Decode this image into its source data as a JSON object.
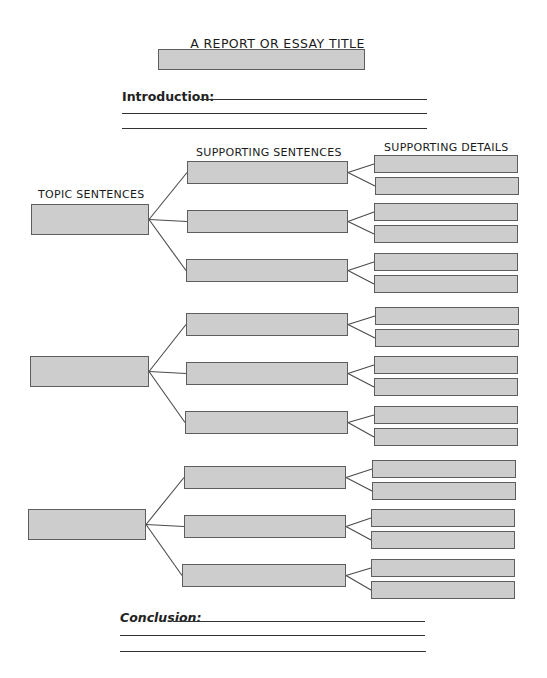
{
  "title": {
    "heading": "A REPORT OR ESSAY TITLE",
    "box": {
      "x": 158,
      "y": 49,
      "w": 207,
      "h": 21
    }
  },
  "introduction": {
    "label": "Introduction:",
    "label_pos": {
      "x": 122,
      "y": 89
    },
    "lines": [
      {
        "x1": 200,
        "x2": 427,
        "y": 99
      },
      {
        "x1": 122,
        "x2": 427,
        "y": 113
      },
      {
        "x1": 122,
        "x2": 427,
        "y": 128
      }
    ]
  },
  "column_headers": {
    "topic": "TOPIC SENTENCES",
    "supporting_sentences": "SUPPORTING SENTENCES",
    "supporting_details": "SUPPORTING DETAILS"
  },
  "column_header_pos": {
    "topic": {
      "x": 38,
      "y": 188
    },
    "supporting_sentences": {
      "x": 196,
      "y": 146
    },
    "supporting_details": {
      "x": 384,
      "y": 141
    }
  },
  "colors": {
    "box_fill": "#cdcdcd",
    "box_border": "#5e5e5e",
    "line": "#333333",
    "connector": "#4a4a4a"
  },
  "sections": [
    {
      "topic": {
        "x": 31,
        "y": 204,
        "w": 118,
        "h": 31
      },
      "supports": [
        {
          "box": {
            "x": 187,
            "y": 161,
            "w": 161,
            "h": 23
          },
          "details": [
            {
              "x": 374,
              "y": 155,
              "w": 144,
              "h": 18
            },
            {
              "x": 375,
              "y": 177,
              "w": 144,
              "h": 18
            }
          ]
        },
        {
          "box": {
            "x": 187,
            "y": 210,
            "w": 161,
            "h": 23
          },
          "details": [
            {
              "x": 374,
              "y": 203,
              "w": 144,
              "h": 18
            },
            {
              "x": 374,
              "y": 225,
              "w": 144,
              "h": 18
            }
          ]
        },
        {
          "box": {
            "x": 186,
            "y": 259,
            "w": 162,
            "h": 23
          },
          "details": [
            {
              "x": 374,
              "y": 253,
              "w": 144,
              "h": 18
            },
            {
              "x": 374,
              "y": 275,
              "w": 144,
              "h": 18
            }
          ]
        }
      ]
    },
    {
      "topic": {
        "x": 30,
        "y": 356,
        "w": 119,
        "h": 31
      },
      "supports": [
        {
          "box": {
            "x": 186,
            "y": 313,
            "w": 162,
            "h": 23
          },
          "details": [
            {
              "x": 375,
              "y": 307,
              "w": 144,
              "h": 18
            },
            {
              "x": 375,
              "y": 329,
              "w": 144,
              "h": 18
            }
          ]
        },
        {
          "box": {
            "x": 186,
            "y": 362,
            "w": 162,
            "h": 23
          },
          "details": [
            {
              "x": 374,
              "y": 356,
              "w": 144,
              "h": 18
            },
            {
              "x": 374,
              "y": 378,
              "w": 144,
              "h": 18
            }
          ]
        },
        {
          "box": {
            "x": 185,
            "y": 411,
            "w": 163,
            "h": 23
          },
          "details": [
            {
              "x": 374,
              "y": 406,
              "w": 144,
              "h": 18
            },
            {
              "x": 374,
              "y": 428,
              "w": 144,
              "h": 18
            }
          ]
        }
      ]
    },
    {
      "topic": {
        "x": 28,
        "y": 509,
        "w": 118,
        "h": 31
      },
      "supports": [
        {
          "box": {
            "x": 184,
            "y": 466,
            "w": 162,
            "h": 23
          },
          "details": [
            {
              "x": 372,
              "y": 460,
              "w": 144,
              "h": 18
            },
            {
              "x": 372,
              "y": 482,
              "w": 144,
              "h": 18
            }
          ]
        },
        {
          "box": {
            "x": 184,
            "y": 515,
            "w": 162,
            "h": 23
          },
          "details": [
            {
              "x": 371,
              "y": 509,
              "w": 144,
              "h": 18
            },
            {
              "x": 371,
              "y": 531,
              "w": 144,
              "h": 18
            }
          ]
        },
        {
          "box": {
            "x": 182,
            "y": 564,
            "w": 164,
            "h": 23
          },
          "details": [
            {
              "x": 371,
              "y": 559,
              "w": 144,
              "h": 18
            },
            {
              "x": 371,
              "y": 581,
              "w": 144,
              "h": 18
            }
          ]
        }
      ]
    }
  ],
  "conclusion": {
    "label": "Conclusion:",
    "label_pos": {
      "x": 120,
      "y": 610
    },
    "lines": [
      {
        "x1": 173,
        "x2": 425,
        "y": 621
      },
      {
        "x1": 120,
        "x2": 425,
        "y": 635
      },
      {
        "x1": 120,
        "x2": 426,
        "y": 651
      }
    ]
  }
}
